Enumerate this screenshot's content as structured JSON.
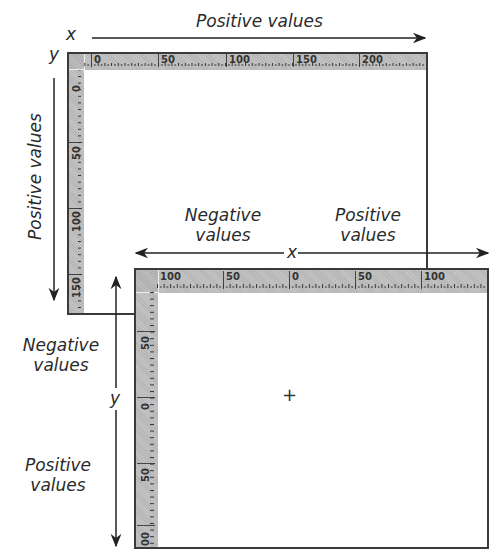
{
  "top_diagram": {
    "x_axis_letter": "x",
    "y_axis_letter": "y",
    "x_direction_label": "Positive values",
    "y_direction_label": "Positive values",
    "ruler_top_ticks": [
      "0",
      "50",
      "100",
      "150",
      "200"
    ],
    "ruler_left_ticks": [
      "0",
      "50",
      "100",
      "150"
    ]
  },
  "bottom_diagram": {
    "x_axis_letter": "x",
    "y_axis_letter": "y",
    "x_negative_label_line1": "Negative",
    "x_negative_label_line2": "values",
    "x_positive_label_line1": "Positive",
    "x_positive_label_line2": "values",
    "y_negative_label_line1": "Negative",
    "y_negative_label_line2": "values",
    "y_positive_label_line1": "Positive",
    "y_positive_label_line2": "values",
    "ruler_top_ticks": [
      "100",
      "50",
      "0",
      "50",
      "100"
    ],
    "ruler_left_ticks": [
      "50",
      "0",
      "50",
      "00"
    ],
    "origin_marker": "+"
  },
  "colors": {
    "ruler_fill": "#c4c4c4",
    "frame_stroke": "#3a3a3a",
    "arrow_stroke": "#222222"
  }
}
